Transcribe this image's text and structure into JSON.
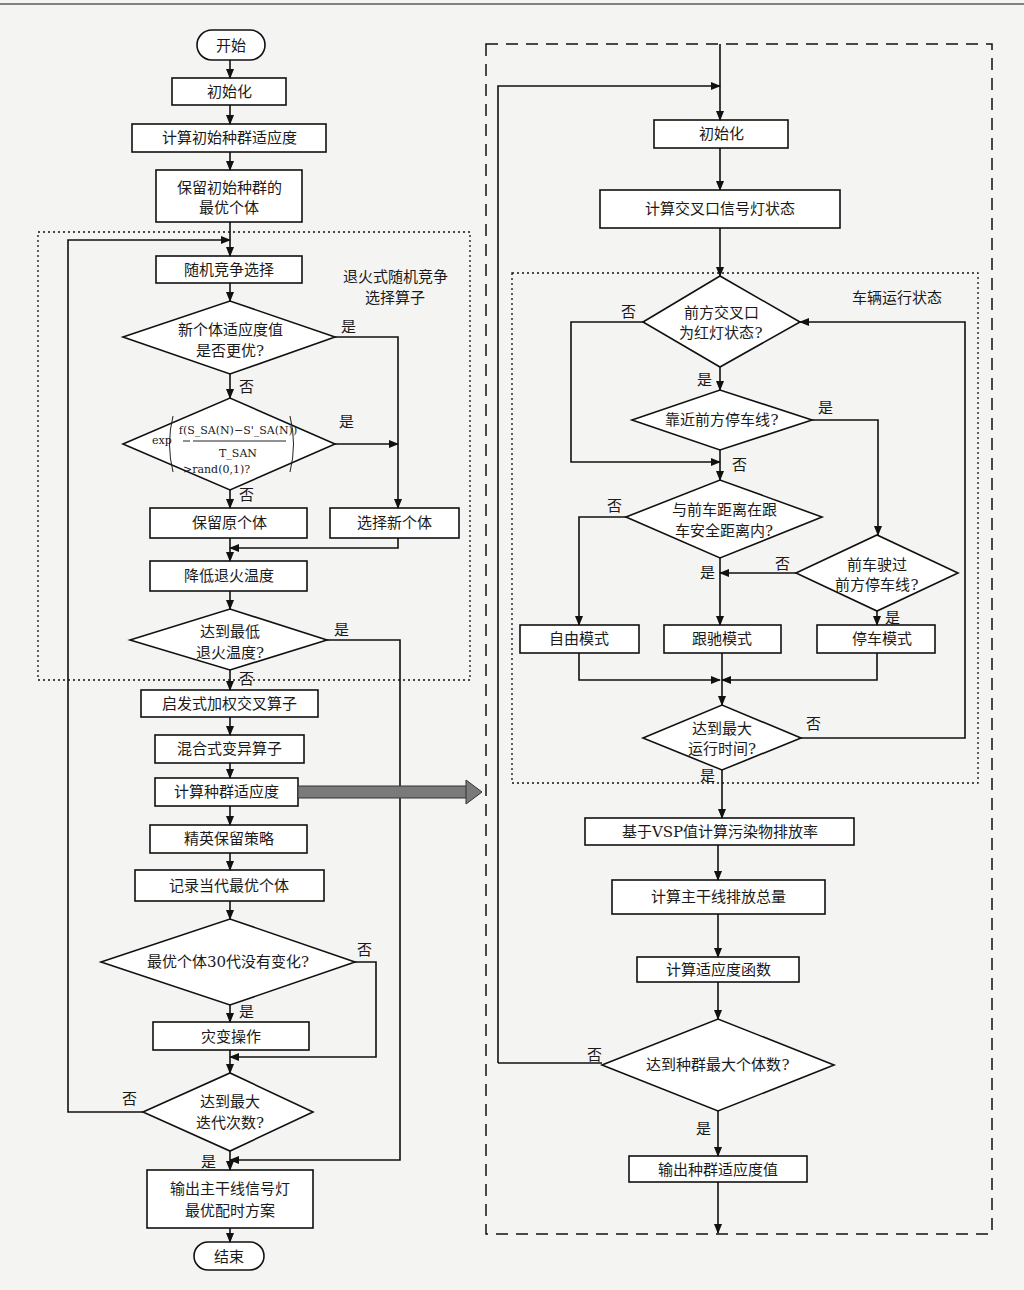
{
  "left_flow": {
    "start": "开始",
    "init": "初始化",
    "calc_init_fitness": "计算初始种群适应度",
    "keep_best_1": "保留初始种群的",
    "keep_best_2": "最优个体",
    "random_select": "随机竞争选择",
    "sa_group_label_1": "退火式随机竞争",
    "sa_group_label_2": "选择算子",
    "better_q_1": "新个体适应度值",
    "better_q_2": "是否更优?",
    "formula_exp": "exp",
    "formula_num": "f(S_SA(N)−S'_SA(N))",
    "formula_den": "T_SAN",
    "formula_cmp": ">rand(0,1)?",
    "keep_original": "保留原个体",
    "select_new": "选择新个体",
    "lower_temp": "降低退火温度",
    "min_temp_q_1": "达到最低",
    "min_temp_q_2": "退火温度?",
    "crossover": "启发式加权交叉算子",
    "mutation": "混合式变异算子",
    "calc_fitness": "计算种群适应度",
    "elite": "精英保留策略",
    "record_best": "记录当代最优个体",
    "no_change_q": "最优个体30代没有变化?",
    "catastrophe": "灾变操作",
    "max_iter_q_1": "达到最大",
    "max_iter_q_2": "迭代次数?",
    "output_1": "输出主干线信号灯",
    "output_2": "最优配时方案",
    "end": "结束"
  },
  "right_flow": {
    "init": "初始化",
    "calc_signal": "计算交叉口信号灯状态",
    "vehicle_group_label": "车辆运行状态",
    "red_q_1": "前方交叉口",
    "red_q_2": "为红灯状态?",
    "near_stop_q": "靠近前方停车线?",
    "dist_q_1": "与前车距离在跟",
    "dist_q_2": "车安全距离内?",
    "passed_q_1": "前车驶过",
    "passed_q_2": "前方停车线?",
    "free_mode": "自由模式",
    "follow_mode": "跟驰模式",
    "stop_mode": "停车模式",
    "max_time_q_1": "达到最大",
    "max_time_q_2": "运行时间?",
    "vsp": "基于VSP值计算污染物排放率",
    "total_emission": "计算主干线排放总量",
    "fitness_fn": "计算适应度函数",
    "max_pop_q": "达到种群最大个体数?",
    "output_fitness": "输出种群适应度值"
  },
  "labels": {
    "yes": "是",
    "no": "否"
  }
}
